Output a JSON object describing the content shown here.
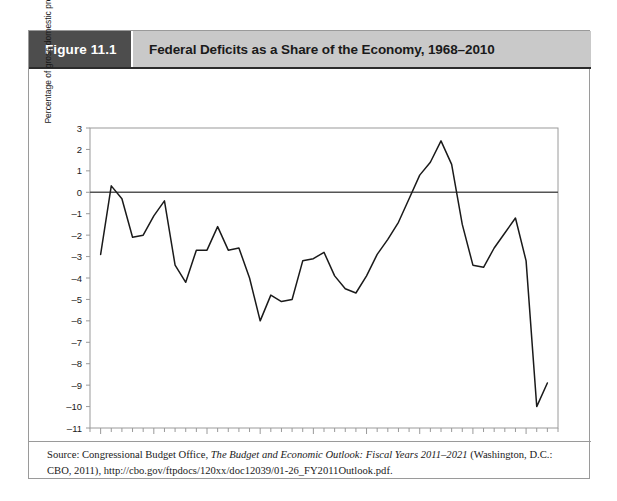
{
  "figure": {
    "number_label": "Figure 11.1",
    "title": "Federal Deficits as a Share of the Economy, 1968–2010"
  },
  "source": {
    "prefix": "Source: Congressional Budget Office, ",
    "italic_title": "The Budget and Economic Outlook: Fiscal Years 2011–2021",
    "suffix": " (Washington, D.C.: CBO, 2011), http://cbo.gov/ftpdocs/120xx/doc12039/01-26_FY2011Outlook.pdf."
  },
  "colors": {
    "figure_number_bg": "#4d4d4d",
    "figure_title_bg": "#c9c9c9",
    "line": "#1a1a1a",
    "zero_line": "#555555",
    "frame": "#9a9a9a",
    "text": "#1a1a1a"
  },
  "chart_data": {
    "type": "line",
    "title": "Federal Deficits as a Share of the Economy, 1968–2010",
    "xlabel": "",
    "ylabel": "Percentage of gross domestic product",
    "xlim": [
      1967,
      2011
    ],
    "ylim": [
      -11,
      3
    ],
    "grid": false,
    "legend": null,
    "zero_reference_line": 0,
    "y_ticks": [
      3,
      2,
      1,
      0,
      -1,
      -2,
      -3,
      -4,
      -5,
      -6,
      -7,
      -8,
      -9,
      -10,
      -11
    ],
    "y_tick_labels": [
      "3",
      "2",
      "1",
      "0",
      "–1",
      "–2",
      "–3",
      "–4",
      "–5",
      "–6",
      "–7",
      "–8",
      "–9",
      "–10",
      "–11"
    ],
    "x_major_ticks": [
      1968,
      1973,
      1978,
      1983,
      1988,
      1993,
      1998,
      2003,
      2008
    ],
    "x_major_tick_labels": [
      "1968",
      "1973",
      "1978",
      "1983",
      "1988",
      "1993",
      "1998",
      "2003",
      "2008"
    ],
    "x_minor_tick_step": 1,
    "x": [
      1968,
      1969,
      1970,
      1971,
      1972,
      1973,
      1974,
      1975,
      1976,
      1977,
      1978,
      1979,
      1980,
      1981,
      1982,
      1983,
      1984,
      1985,
      1986,
      1987,
      1988,
      1989,
      1990,
      1991,
      1992,
      1993,
      1994,
      1995,
      1996,
      1997,
      1998,
      1999,
      2000,
      2001,
      2002,
      2003,
      2004,
      2005,
      2006,
      2007,
      2008,
      2009,
      2010
    ],
    "values": [
      -2.9,
      0.3,
      -0.3,
      -2.1,
      -2.0,
      -1.1,
      -0.4,
      -3.4,
      -4.2,
      -2.7,
      -2.7,
      -1.6,
      -2.7,
      -2.6,
      -4.0,
      -6.0,
      -4.8,
      -5.1,
      -5.0,
      -3.2,
      -3.1,
      -2.8,
      -3.9,
      -4.5,
      -4.7,
      -3.9,
      -2.9,
      -2.2,
      -1.4,
      -0.3,
      0.8,
      1.4,
      2.4,
      1.3,
      -1.5,
      -3.4,
      -3.5,
      -2.6,
      -1.9,
      -1.2,
      -3.2,
      -10.0,
      -8.9
    ]
  }
}
